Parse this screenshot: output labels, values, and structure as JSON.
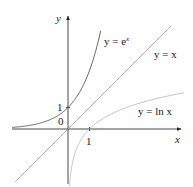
{
  "chart_data": {
    "type": "line",
    "title": "",
    "xlabel": "x",
    "ylabel": "y",
    "xlim": [
      -3,
      5.2
    ],
    "ylim": [
      -2.7,
      5.2
    ],
    "grid": false,
    "legend": "inline labels",
    "ticks": {
      "x": [
        {
          "value": 1,
          "label": "1"
        }
      ],
      "y": [
        {
          "value": 1,
          "label": "1"
        }
      ],
      "origin_label": "0"
    },
    "series": [
      {
        "name": "y = e^x",
        "label_main": "y = e",
        "label_sup": "x",
        "function": "exp",
        "color": "#555555",
        "x": [
          -3,
          -2,
          -1,
          0,
          0.5,
          1,
          1.5,
          2,
          2.2
        ],
        "y": [
          0.05,
          0.14,
          0.37,
          1,
          1.65,
          2.72,
          4.48,
          7.39,
          9.03
        ]
      },
      {
        "name": "y = x",
        "label": "y = x",
        "function": "identity",
        "color": "#9a9a9a",
        "x": [
          -2.5,
          0,
          4.9
        ],
        "y": [
          -2.5,
          0,
          4.9
        ]
      },
      {
        "name": "y = ln x",
        "label": "y = ln x",
        "function": "log",
        "color": "#bdbdbd",
        "x": [
          0.07,
          0.14,
          0.37,
          1,
          2,
          3,
          4,
          5.2
        ],
        "y": [
          -2.66,
          -1.97,
          -1,
          0,
          0.69,
          1.1,
          1.39,
          1.65
        ]
      }
    ]
  }
}
